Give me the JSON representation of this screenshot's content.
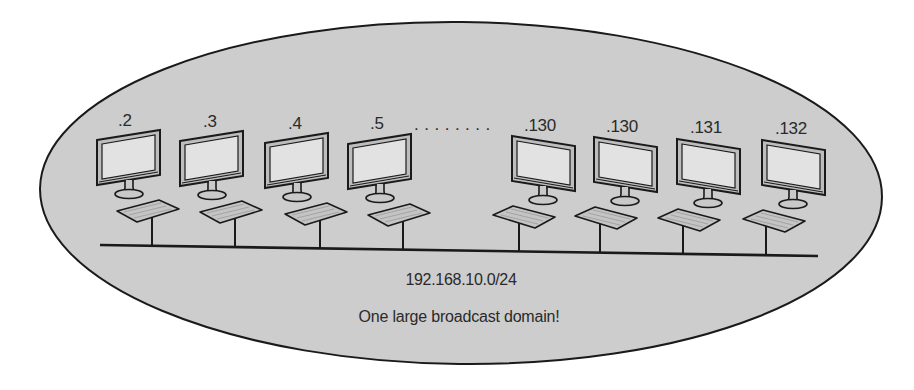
{
  "diagram": {
    "title": "One large broadcast domain",
    "colors": {
      "background": "#ffffff",
      "domain_fill": "#cdcdcd",
      "outline": "#1a1a1a",
      "screen_fill": "#e2e2e2",
      "keyboard_fill": "#c4c4c4",
      "text": "#2a2a2a"
    },
    "broadcast_domain": {
      "shape": "ellipse",
      "network_label": "192.168.10.0/24",
      "caption": "One large broadcast domain!"
    },
    "ellipsis": "........",
    "hosts": [
      {
        "label": ".2",
        "side": "left"
      },
      {
        "label": ".3",
        "side": "left"
      },
      {
        "label": ".4",
        "side": "left"
      },
      {
        "label": ".5",
        "side": "left"
      },
      {
        "label": ".130",
        "side": "right"
      },
      {
        "label": ".130",
        "side": "right"
      },
      {
        "label": ".131",
        "side": "right"
      },
      {
        "label": ".132",
        "side": "right"
      }
    ],
    "bus": {
      "type": "shared ethernet segment"
    }
  }
}
